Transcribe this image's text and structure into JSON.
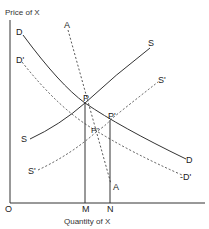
{
  "diagram": {
    "title": "",
    "y_axis_label": "Price of X",
    "x_axis_label": "Quantity of X",
    "origin_label": "O",
    "colors": {
      "line": "#333333",
      "background": "#ffffff"
    },
    "curves": {
      "D": {
        "label_start": "D",
        "label_end": "D",
        "style": "solid"
      },
      "D_prime": {
        "label_start": "D'",
        "label_end": "-D'",
        "style": "dashed"
      },
      "S": {
        "label_start": "S",
        "label_end": "S",
        "style": "solid"
      },
      "S_prime": {
        "label_start": "S'",
        "label_end": "S'",
        "style": "dashed"
      },
      "A": {
        "label_start": "A",
        "label_end": "A",
        "style": "dashed"
      }
    },
    "points": {
      "P": "P",
      "P_prime": "P'",
      "P_double_prime": "P''"
    },
    "x_ticks": {
      "M": "M",
      "N": "N"
    }
  }
}
